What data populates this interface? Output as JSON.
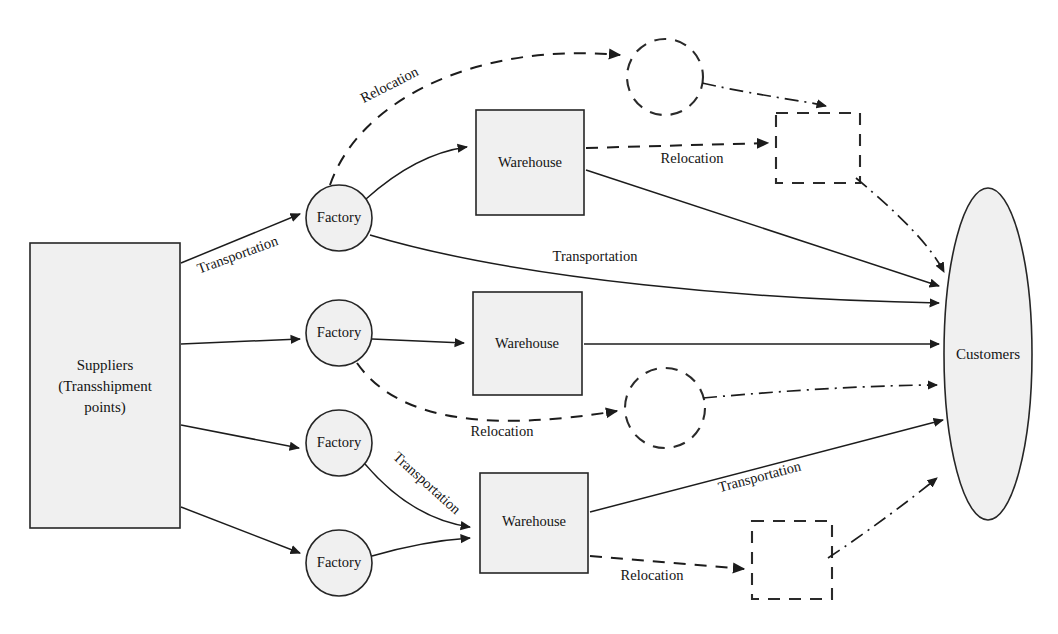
{
  "diagram": {
    "canvas": {
      "width": 1058,
      "height": 634,
      "background": "#ffffff"
    },
    "colors": {
      "node_fill": "#f0f0f0",
      "node_stroke": "#262626",
      "edge_stroke": "#1c1c1c",
      "ghost_stroke": "#2a2a2a"
    },
    "nodes": {
      "suppliers": {
        "label_line1": "Suppliers",
        "label_line2": "(Transshipment",
        "label_line3": "points)",
        "shape": "rectangle"
      },
      "factories": [
        {
          "label": "Factory",
          "shape": "circle"
        },
        {
          "label": "Factory",
          "shape": "circle"
        },
        {
          "label": "Factory",
          "shape": "circle"
        },
        {
          "label": "Factory",
          "shape": "circle"
        }
      ],
      "warehouses": [
        {
          "label": "Warehouse",
          "shape": "square"
        },
        {
          "label": "Warehouse",
          "shape": "square"
        },
        {
          "label": "Warehouse",
          "shape": "square"
        }
      ],
      "customers": {
        "label": "Customers",
        "shape": "ellipse"
      },
      "relocation_targets": [
        {
          "label": "",
          "shape": "dashed-circle"
        },
        {
          "label": "",
          "shape": "dashed-square"
        },
        {
          "label": "",
          "shape": "dashed-circle"
        },
        {
          "label": "",
          "shape": "dashed-square"
        }
      ]
    },
    "edge_labels": {
      "supplier_to_factory": "Transportation",
      "factory_relocation_top": "Relocation",
      "warehouse_relocation_top": "Relocation",
      "factory_to_customer": "Transportation",
      "factory_relocation_mid": "Relocation",
      "factory_to_warehouse_bottom": "Transportation",
      "warehouse_to_customer_bottom": "Transportation",
      "warehouse_relocation_bottom": "Relocation"
    },
    "legend_flow_types": {
      "solid": "Transportation",
      "dashed": "Relocation",
      "dash_dot": "Relocated facility flow"
    }
  }
}
